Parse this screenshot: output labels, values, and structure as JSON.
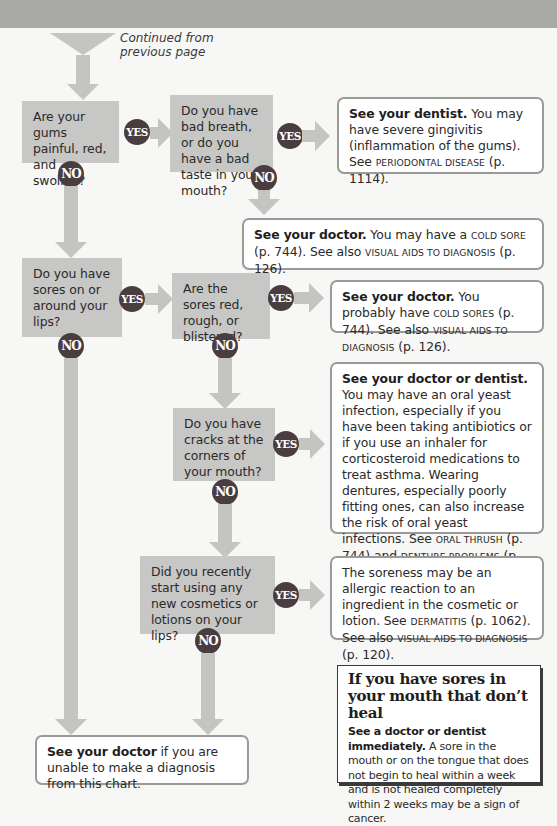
{
  "header": {
    "band_color": "#a9a9a7"
  },
  "start": {
    "continued_line1": "Continued from",
    "continued_line2": "previous page"
  },
  "badges": {
    "yes": "YES",
    "no": "NO"
  },
  "questions": [
    {
      "id": "q1",
      "text": "Are your gums painful, red, and swollen?"
    },
    {
      "id": "q2",
      "text": "Do you have bad breath, or do you have a bad taste in your mouth?"
    },
    {
      "id": "q3",
      "text": "Do you have sores on or around your lips?"
    },
    {
      "id": "q4",
      "text": "Are the sores red, rough, or blistered?"
    },
    {
      "id": "q5",
      "text": "Do you have cracks at the corners of your mouth?"
    },
    {
      "id": "q6",
      "text": "Did you recently start using any new cosmetics or lotions on your lips?"
    }
  ],
  "results": {
    "r1": {
      "bold": "See your dentist.",
      "text1": " You may have severe gingivitis (inflammation of the gums). See ",
      "ref1": "Periodontal disease",
      "text2": " (p. 1114)."
    },
    "r2": {
      "bold": "See your doctor.",
      "text1": " You may have a ",
      "ref1": "cold sore",
      "text2": " (p. 744). See also ",
      "ref2": "visual aids to diagnosis",
      "text3": " (p. 126)."
    },
    "r3": {
      "bold": "See your doctor.",
      "text1": " You probably have ",
      "ref1": "cold sores",
      "text2": " (p. 744). See also ",
      "ref2": "visual aids to diagnosis",
      "text3": " (p. 126)."
    },
    "r4": {
      "bold": "See your doctor or dentist.",
      "text1": " You may have an oral yeast infection, especially if you have been taking antibiotics or if you use an inhaler for corticosteroid medications to treat asthma. Wearing dentures, especially poorly fitting ones, can also increase the risk of oral yeast infections. See ",
      "ref1": "oral thrush",
      "text2": " (p. 744) and ",
      "ref2": "denture problems",
      "text3": " (p. 1113)."
    },
    "r5": {
      "text1": "The soreness may be an allergic reaction to an ingredient in the cosmetic or lotion. See ",
      "ref1": "dermatitis",
      "text2": " (p. 1062). See also ",
      "ref2": "visual aids to diagnosis",
      "text3": " (p. 120)."
    },
    "final": {
      "bold": "See your doctor",
      "text1": " if you are unable to make a diagnosis from this chart."
    }
  },
  "info_box": {
    "title": "If you have sores in your mouth that don’t heal",
    "bold": "See a doctor or dentist immediately.",
    "text": " A sore in the mouth or on the tongue that does not begin to heal within a week and is not healed completely within 2 weeks may be a sign of cancer."
  },
  "colors": {
    "question_box": "#c7c7c5",
    "arrow": "#c4c4c2",
    "badge": "#4a3d40",
    "result_border": "#9a9a98"
  }
}
